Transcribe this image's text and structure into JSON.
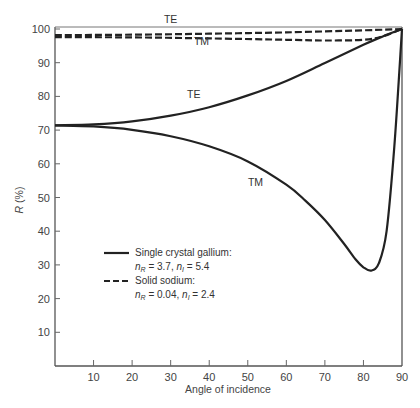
{
  "chart_data": {
    "type": "line",
    "title": "",
    "xlabel": "Angle of incidence",
    "ylabel": "R (%)",
    "xlim": [
      0,
      90
    ],
    "ylim": [
      0,
      100
    ],
    "grid": false,
    "x_ticks": [
      10,
      20,
      30,
      40,
      50,
      60,
      70,
      80,
      90
    ],
    "y_ticks": [
      10,
      20,
      30,
      40,
      50,
      60,
      70,
      80,
      90,
      100
    ],
    "legend": {
      "position": "lower-left inside",
      "entries": [
        {
          "style": "solid",
          "label": "Single crystal gallium:",
          "params": "n_R = 3.7, n_I = 5.4",
          "nR": "3.7",
          "nI": "5.4"
        },
        {
          "style": "dashed",
          "label": "Solid sodium:",
          "params": "n_R = 0.04, n_I = 2.4",
          "nR": "0.04",
          "nI": "2.4"
        }
      ]
    },
    "series": [
      {
        "name": "Gallium TE",
        "material": "Single crystal gallium",
        "polarization": "TE",
        "style": "solid",
        "x": [
          0,
          10,
          20,
          30,
          40,
          50,
          60,
          70,
          80,
          85,
          90
        ],
        "y": [
          71.4,
          71.7,
          72.6,
          74.3,
          76.8,
          80.3,
          84.6,
          89.9,
          95.3,
          97.8,
          100
        ]
      },
      {
        "name": "Gallium TM",
        "material": "Single crystal gallium",
        "polarization": "TM",
        "style": "solid",
        "x": [
          0,
          10,
          20,
          30,
          40,
          50,
          60,
          65,
          70,
          75,
          78,
          80,
          82,
          84,
          86,
          88,
          90
        ],
        "y": [
          71.4,
          71.1,
          70.1,
          68.2,
          65.2,
          60.7,
          53.8,
          49.0,
          43.3,
          36.2,
          31.6,
          29.3,
          28.3,
          30.5,
          40.0,
          65.0,
          100
        ]
      },
      {
        "name": "Sodium TE",
        "material": "Solid sodium",
        "polarization": "TE",
        "style": "dashed",
        "x": [
          0,
          20,
          40,
          60,
          80,
          90
        ],
        "y": [
          98.2,
          98.3,
          98.6,
          99.0,
          99.6,
          100
        ]
      },
      {
        "name": "Sodium TM",
        "material": "Solid sodium",
        "polarization": "TM",
        "style": "dashed",
        "x": [
          0,
          20,
          40,
          60,
          70,
          80,
          85,
          90
        ],
        "y": [
          97.6,
          97.5,
          97.2,
          96.8,
          96.6,
          96.8,
          97.8,
          100
        ]
      }
    ],
    "annotations": [
      {
        "text": "TE",
        "x": 30,
        "y": 101.8,
        "target": "Sodium TE"
      },
      {
        "text": "TM",
        "x": 38,
        "y": 95.2,
        "target": "Sodium TM"
      },
      {
        "text": "TE",
        "x": 36,
        "y": 79.5,
        "target": "Gallium TE"
      },
      {
        "text": "TM",
        "x": 52,
        "y": 53.5,
        "target": "Gallium TM"
      }
    ]
  },
  "labels": {
    "ylabel_main": "R",
    "ylabel_unit": " (%)",
    "xlabel": "Angle of incidence",
    "legend_gallium": "Single crystal gallium:",
    "legend_gallium_nR": "3.7",
    "legend_gallium_nI": "5.4",
    "legend_sodium": "Solid sodium:",
    "legend_sodium_nR": "0.04",
    "legend_sodium_nI": "2.4"
  }
}
